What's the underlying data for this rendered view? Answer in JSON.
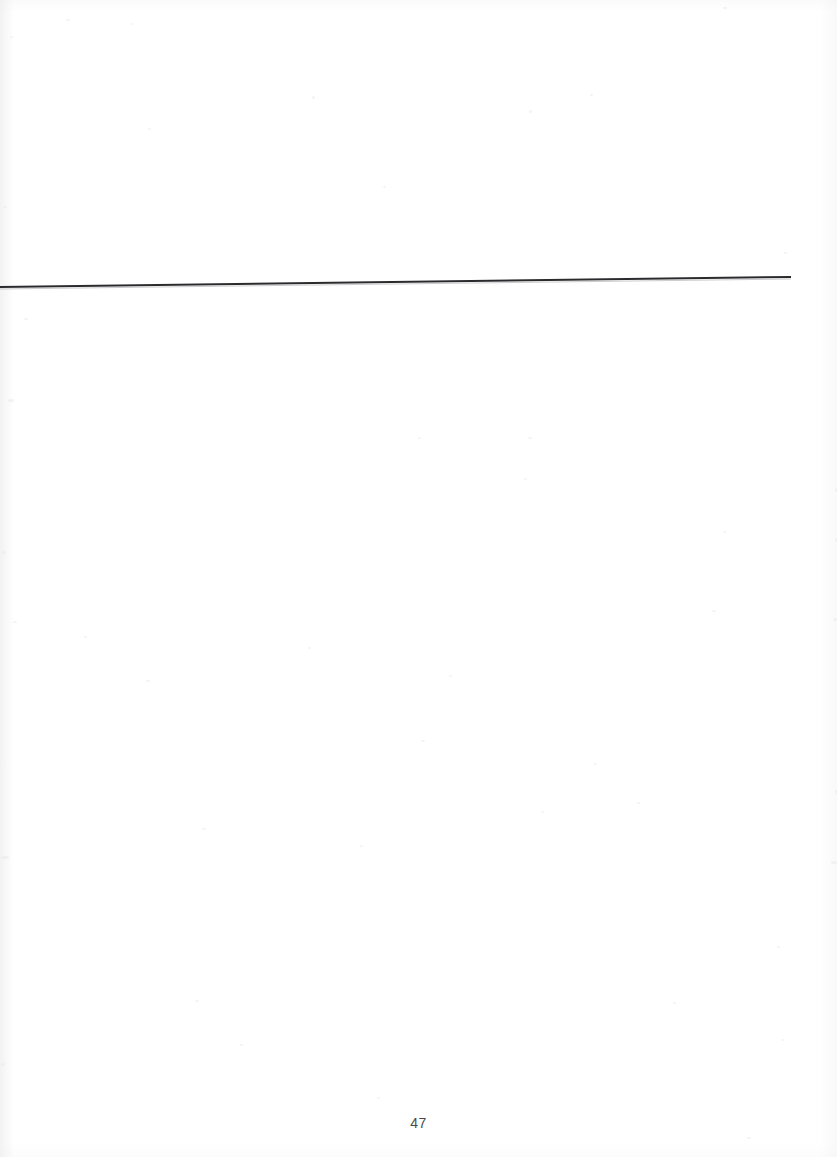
{
  "document": {
    "page_number": "47",
    "background_color": "#ffffff",
    "width": 837,
    "height": 1157
  },
  "header_rule": {
    "name": "horizontal-rule",
    "color": "#2b2b2e",
    "thickness_px": 2,
    "start_x": 0,
    "start_y": 287,
    "end_x": 791,
    "end_y": 277,
    "note": ""
  },
  "header_area": {
    "content": ""
  },
  "body_area": {
    "content": ""
  },
  "footer": {
    "page_label": "47"
  },
  "speckles": [
    {
      "x": 10,
      "y": 36,
      "w": 3,
      "h": 2
    },
    {
      "x": 66,
      "y": 19,
      "w": 4,
      "h": 2
    },
    {
      "x": 131,
      "y": 23,
      "w": 3,
      "h": 2
    },
    {
      "x": 148,
      "y": 128,
      "w": 3,
      "h": 2
    },
    {
      "x": 312,
      "y": 96,
      "w": 3,
      "h": 3
    },
    {
      "x": 383,
      "y": 186,
      "w": 3,
      "h": 2
    },
    {
      "x": 529,
      "y": 110,
      "w": 3,
      "h": 3
    },
    {
      "x": 590,
      "y": 94,
      "w": 3,
      "h": 2
    },
    {
      "x": 723,
      "y": 7,
      "w": 4,
      "h": 2
    },
    {
      "x": 784,
      "y": 252,
      "w": 3,
      "h": 2
    },
    {
      "x": 3,
      "y": 206,
      "w": 4,
      "h": 2
    },
    {
      "x": 24,
      "y": 318,
      "w": 4,
      "h": 2
    },
    {
      "x": 8,
      "y": 399,
      "w": 6,
      "h": 3
    },
    {
      "x": 2,
      "y": 551,
      "w": 4,
      "h": 3
    },
    {
      "x": 13,
      "y": 621,
      "w": 4,
      "h": 2
    },
    {
      "x": 84,
      "y": 636,
      "w": 3,
      "h": 2
    },
    {
      "x": 146,
      "y": 680,
      "w": 4,
      "h": 2
    },
    {
      "x": 308,
      "y": 647,
      "w": 3,
      "h": 2
    },
    {
      "x": 418,
      "y": 437,
      "w": 3,
      "h": 2
    },
    {
      "x": 528,
      "y": 437,
      "w": 4,
      "h": 2
    },
    {
      "x": 524,
      "y": 478,
      "w": 3,
      "h": 2
    },
    {
      "x": 723,
      "y": 531,
      "w": 3,
      "h": 2
    },
    {
      "x": 835,
      "y": 488,
      "w": 3,
      "h": 4
    },
    {
      "x": 835,
      "y": 538,
      "w": 3,
      "h": 4
    },
    {
      "x": 712,
      "y": 610,
      "w": 4,
      "h": 2
    },
    {
      "x": 833,
      "y": 618,
      "w": 4,
      "h": 3
    },
    {
      "x": 449,
      "y": 675,
      "w": 3,
      "h": 2
    },
    {
      "x": 421,
      "y": 740,
      "w": 4,
      "h": 2
    },
    {
      "x": 1,
      "y": 856,
      "w": 8,
      "h": 3
    },
    {
      "x": 202,
      "y": 828,
      "w": 4,
      "h": 2
    },
    {
      "x": 360,
      "y": 845,
      "w": 3,
      "h": 2
    },
    {
      "x": 1,
      "y": 1063,
      "w": 4,
      "h": 3
    },
    {
      "x": 195,
      "y": 1000,
      "w": 4,
      "h": 2
    },
    {
      "x": 377,
      "y": 1097,
      "w": 3,
      "h": 2
    },
    {
      "x": 594,
      "y": 763,
      "w": 3,
      "h": 2
    },
    {
      "x": 637,
      "y": 802,
      "w": 3,
      "h": 2
    },
    {
      "x": 541,
      "y": 811,
      "w": 3,
      "h": 2
    },
    {
      "x": 835,
      "y": 790,
      "w": 3,
      "h": 4
    },
    {
      "x": 831,
      "y": 861,
      "w": 6,
      "h": 3
    },
    {
      "x": 747,
      "y": 1137,
      "w": 4,
      "h": 2
    },
    {
      "x": 781,
      "y": 1039,
      "w": 3,
      "h": 2
    },
    {
      "x": 673,
      "y": 1002,
      "w": 3,
      "h": 2
    },
    {
      "x": 240,
      "y": 1044,
      "w": 3,
      "h": 2
    },
    {
      "x": 777,
      "y": 946,
      "w": 3,
      "h": 2
    }
  ]
}
